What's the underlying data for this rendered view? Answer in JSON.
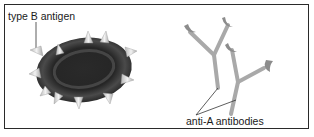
{
  "diagram": {
    "labels": {
      "antigen": "type B antigen",
      "antibodies": "anti-A antibodies"
    },
    "elements": {
      "cell": "red blood cell with type B antigens",
      "antibodies": [
        "anti-A antibody 1",
        "anti-A antibody 2"
      ]
    },
    "colors": {
      "cell_dark": "#1c1c1c",
      "cell_mid": "#3a3a3a",
      "antigen_spike": "#d8d8d8",
      "antibody": "#a9a9a9",
      "antibody_tip": "#8a8a8a",
      "border": "#2a2a2a"
    }
  }
}
